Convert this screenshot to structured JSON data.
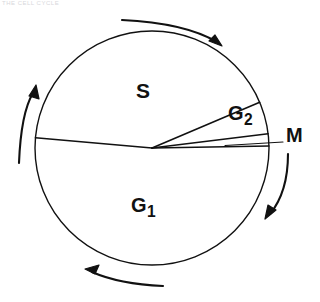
{
  "figure": {
    "background_color": "#ffffff",
    "stroke_color": "#111111",
    "artifact_text": "THE CELL CYCLE"
  },
  "circle": {
    "center_x": 152,
    "center_y": 148,
    "radius": 117
  },
  "phases": [
    {
      "id": "S",
      "label": "S",
      "subscript": "",
      "start_angle_deg": 175,
      "end_angle_deg": 337,
      "label_x": 143,
      "label_y": 92
    },
    {
      "id": "G2",
      "label": "G",
      "subscript": "2",
      "start_angle_deg": 337,
      "end_angle_deg": 353,
      "label_x": 243,
      "label_y": 114
    },
    {
      "id": "M",
      "label": "M",
      "subscript": "",
      "start_angle_deg": 353,
      "end_angle_deg": 359,
      "label_x": 295,
      "label_y": 136
    },
    {
      "id": "G1",
      "label": "G",
      "subscript": "1",
      "start_angle_deg": 359,
      "end_angle_deg": 175,
      "label_x": 148,
      "label_y": 206
    }
  ],
  "leader_line": {
    "for_phase": "M",
    "from_x": 225,
    "from_y": 146,
    "to_x": 283,
    "to_y": 142
  },
  "direction_arrows": [
    {
      "id": "arrow-top",
      "direction": "clockwise",
      "points_toward": "right"
    },
    {
      "id": "arrow-right",
      "direction": "clockwise",
      "points_toward": "down"
    },
    {
      "id": "arrow-bottom",
      "direction": "clockwise",
      "points_toward": "left"
    },
    {
      "id": "arrow-left",
      "direction": "clockwise",
      "points_toward": "up"
    }
  ]
}
